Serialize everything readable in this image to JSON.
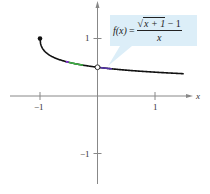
{
  "chart_data": {
    "type": "line",
    "title": "",
    "function_label": {
      "lhs": "f(x)",
      "equals": "=",
      "numerator_radical": "x + 1",
      "numerator_rest": " − 1",
      "denominator": "x",
      "sqrt_symbol": "√"
    },
    "xlabel": "x",
    "ylabel": "y",
    "xlim": [
      -1.4,
      1.9
    ],
    "ylim": [
      -1.5,
      1.65
    ],
    "x_ticks": [
      -1,
      1
    ],
    "x_tick_labels": [
      "−1",
      "1"
    ],
    "y_ticks": [
      1,
      -1
    ],
    "y_tick_labels": [
      "1",
      "−1"
    ],
    "grid": false,
    "series": [
      {
        "name": "f(x) = (√(x+1) − 1)/x",
        "x": [
          -1,
          -0.95,
          -0.9,
          -0.8,
          -0.7,
          -0.6,
          -0.5,
          -0.4,
          -0.3,
          -0.2,
          -0.1,
          0,
          0.25,
          0.5,
          0.75,
          1,
          1.25,
          1.5
        ],
        "y": [
          1,
          0.817,
          0.76,
          0.691,
          0.646,
          0.613,
          0.586,
          0.564,
          0.545,
          0.528,
          0.513,
          0.5,
          0.472,
          0.45,
          0.43,
          0.414,
          0.4,
          0.387
        ],
        "color": "#111111"
      }
    ],
    "annotations": [
      {
        "type": "closed_point",
        "x": -1,
        "y": 1
      },
      {
        "type": "open_point",
        "x": 0,
        "y": 0.5
      }
    ],
    "highlight_segments": [
      {
        "color": "#8a2be2",
        "x_range": [
          -0.55,
          -0.5
        ]
      },
      {
        "color": "#3cb043",
        "x_range": [
          -0.5,
          -0.25
        ]
      },
      {
        "color": "#5533aa",
        "x_range": [
          0.05,
          0.25
        ]
      }
    ],
    "callout_color": "#dceef8"
  }
}
